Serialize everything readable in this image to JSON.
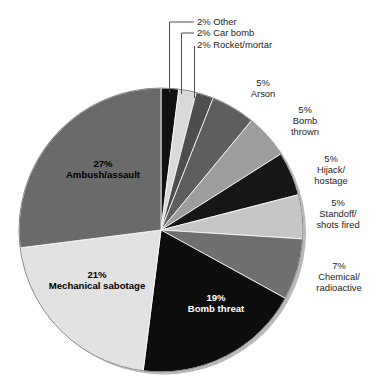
{
  "chart_data": {
    "type": "pie",
    "title": "",
    "subtitle": "",
    "xlabel": "",
    "ylabel": "",
    "legend_position": "none",
    "grid": false,
    "units": "percent",
    "start_angle_deg": 0,
    "direction": "clockwise",
    "categories": [
      "Other",
      "Car bomb",
      "Rocket/mortar",
      "Arson",
      "Bomb thrown",
      "Hijack/hostage",
      "Standoff/shots fired",
      "Chemical/radioactive",
      "Bomb threat",
      "Mechanical sabotage",
      "Ambush/assault"
    ],
    "values": [
      2,
      2,
      2,
      5,
      5,
      5,
      5,
      7,
      19,
      21,
      27
    ],
    "value_labels": [
      "2%",
      "2%",
      "2%",
      "5%",
      "5%",
      "5%",
      "5%",
      "7%",
      "19%",
      "21%",
      "27%"
    ],
    "colors": [
      "#111111",
      "#d9d9d9",
      "#4e4e4e",
      "#5e5e5e",
      "#9d9d9d",
      "#161616",
      "#c6c6c6",
      "#6f6f6f",
      "#0d0d0d",
      "#e2e2e2",
      "#6a6a6a"
    ],
    "slices": [
      {
        "label": "Other",
        "value": 2,
        "value_label": "2%",
        "color": "#111111",
        "label_placement": "leader",
        "label_text": "2% Other"
      },
      {
        "label": "Car bomb",
        "value": 2,
        "value_label": "2%",
        "color": "#d9d9d9",
        "label_placement": "leader",
        "label_text": "2% Car bomb"
      },
      {
        "label": "Rocket/mortar",
        "value": 2,
        "value_label": "2%",
        "color": "#4e4e4e",
        "label_placement": "leader",
        "label_text": "2% Rocket/mortar"
      },
      {
        "label": "Arson",
        "value": 5,
        "value_label": "5%",
        "color": "#5e5e5e",
        "label_placement": "outside",
        "lines": [
          "5%",
          "Arson"
        ]
      },
      {
        "label": "Bomb thrown",
        "value": 5,
        "value_label": "5%",
        "color": "#9d9d9d",
        "label_placement": "outside",
        "lines": [
          "5%",
          "Bomb",
          "thrown"
        ]
      },
      {
        "label": "Hijack/hostage",
        "value": 5,
        "value_label": "5%",
        "color": "#161616",
        "label_placement": "outside",
        "lines": [
          "5%",
          "Hijack/",
          "hostage"
        ]
      },
      {
        "label": "Standoff/shots fired",
        "value": 5,
        "value_label": "5%",
        "color": "#c6c6c6",
        "label_placement": "outside",
        "lines": [
          "5%",
          "Standoff/",
          "shots fired"
        ]
      },
      {
        "label": "Chemical/radioactive",
        "value": 7,
        "value_label": "7%",
        "color": "#6f6f6f",
        "label_placement": "outside",
        "lines": [
          "7%",
          "Chemical/",
          "radioactive"
        ]
      },
      {
        "label": "Bomb threat",
        "value": 19,
        "value_label": "19%",
        "color": "#0d0d0d",
        "label_placement": "inside",
        "lines": [
          "19%",
          "Bomb threat"
        ]
      },
      {
        "label": "Mechanical sabotage",
        "value": 21,
        "value_label": "21%",
        "color": "#e2e2e2",
        "label_placement": "inside",
        "lines": [
          "21%",
          "Mechanical sabotage"
        ]
      },
      {
        "label": "Ambush/assault",
        "value": 27,
        "value_label": "27%",
        "color": "#6a6a6a",
        "label_placement": "inside",
        "lines": [
          "27%",
          "Ambush/assault"
        ]
      }
    ]
  },
  "callouts": {
    "other": "2% Other",
    "car_bomb": "2% Car bomb",
    "rocket_mortar": "2% Rocket/mortar",
    "arson_pct": "5%",
    "arson_name": "Arson",
    "bomb_thrown_pct": "5%",
    "bomb_thrown_l1": "Bomb",
    "bomb_thrown_l2": "thrown",
    "hijack_pct": "5%",
    "hijack_l1": "Hijack/",
    "hijack_l2": "hostage",
    "standoff_pct": "5%",
    "standoff_l1": "Standoff/",
    "standoff_l2": "shots fired",
    "chemical_pct": "7%",
    "chemical_l1": "Chemical/",
    "chemical_l2": "radioactive"
  },
  "inside_labels": {
    "ambush_pct": "27%",
    "ambush_name": "Ambush/assault",
    "mechanical_pct": "21%",
    "mechanical_name": "Mechanical sabotage",
    "bomb_threat_pct": "19%",
    "bomb_threat_name": "Bomb threat"
  }
}
